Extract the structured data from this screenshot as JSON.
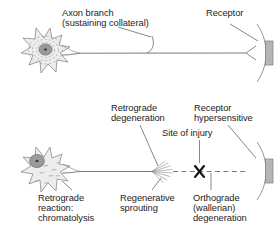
{
  "figure": {
    "colors": {
      "stroke": "#6e6e6e",
      "text": "#1c1c1c",
      "soma_fill": "#ededed",
      "nucleus_fill": "#9a9a9a",
      "nucleolus_fill": "#4a4a4a",
      "receptor_fill": "#b5b5b5",
      "background": "#ffffff"
    },
    "panels": [
      {
        "name": "normal-neuron-panel",
        "description": "Intact motor neuron with axon branch and innervated receptor",
        "labels": [
          {
            "id": "axon-branch",
            "line1": "Axon branch",
            "line2": "(sustaining collateral)"
          },
          {
            "id": "receptor",
            "line1": "Receptor",
            "line2": ""
          }
        ]
      },
      {
        "name": "injured-neuron-panel",
        "description": "Injured motor neuron showing chromatolysis, regenerative sprouting, site of injury and wallerian degeneration",
        "labels": [
          {
            "id": "retrograde-degeneration",
            "line1": "Retrograde",
            "line2": "degeneration"
          },
          {
            "id": "receptor-hypersensitive",
            "line1": "Receptor",
            "line2": "hypersensitive"
          },
          {
            "id": "site-of-injury",
            "line1": "Site of injury",
            "line2": ""
          },
          {
            "id": "retrograde-reaction",
            "line1": "Retrograde",
            "line2": "reaction:",
            "line3": "chromatolysis"
          },
          {
            "id": "regenerative-sprouting",
            "line1": "Regenerative",
            "line2": "sprouting"
          },
          {
            "id": "orthograde-degeneration",
            "line1": "Orthograde",
            "line2": "(wallerian)",
            "line3": "degeneration"
          }
        ],
        "markers": [
          {
            "id": "injury-x-marker",
            "glyph": "X"
          }
        ]
      }
    ]
  }
}
